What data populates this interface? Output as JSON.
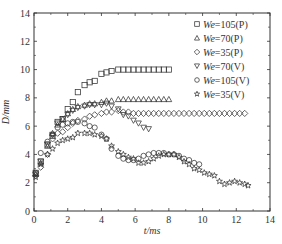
{
  "chart_data": {
    "type": "scatter",
    "title": "",
    "xlabel": "t/ms",
    "ylabel": "D/mm",
    "xlim": [
      0,
      14
    ],
    "ylim": [
      0,
      14
    ],
    "x_ticks": [
      0,
      2,
      4,
      6,
      8,
      10,
      12,
      14
    ],
    "y_ticks": [
      0,
      2,
      4,
      6,
      8,
      10,
      12,
      14
    ],
    "grid": false,
    "legend_position": "upper right",
    "series": [
      {
        "name": "We=105(P)",
        "marker": "square",
        "x": [
          0.1,
          0.4,
          0.8,
          1.1,
          1.4,
          1.7,
          2.0,
          2.3,
          2.6,
          3.0,
          3.3,
          3.6,
          4.0,
          4.3,
          4.6,
          5.0,
          5.3,
          5.6,
          5.9,
          6.2,
          6.5,
          6.8,
          7.1,
          7.4,
          7.7,
          8.0
        ],
        "y": [
          2.7,
          3.5,
          4.7,
          5.3,
          6.3,
          6.5,
          7.2,
          7.7,
          8.4,
          8.9,
          9.1,
          9.2,
          9.7,
          9.8,
          9.9,
          10.0,
          10.0,
          10.0,
          10.0,
          10.0,
          10.0,
          10.0,
          10.0,
          10.0,
          10.0,
          10.0
        ]
      },
      {
        "name": "We=70(P)",
        "marker": "triangle-up",
        "x": [
          0.1,
          0.4,
          0.8,
          1.1,
          1.4,
          1.7,
          2.0,
          2.3,
          2.6,
          3.0,
          3.3,
          3.6,
          4.0,
          4.3,
          4.6,
          5.0,
          5.3,
          5.6,
          5.9,
          6.2,
          6.5,
          6.8,
          7.1,
          7.4,
          7.7,
          8.0
        ],
        "y": [
          2.6,
          3.4,
          4.6,
          5.5,
          6.1,
          6.5,
          6.9,
          7.2,
          7.4,
          7.5,
          7.6,
          7.6,
          7.7,
          7.8,
          7.8,
          7.9,
          7.9,
          7.9,
          7.9,
          7.9,
          7.9,
          7.9,
          7.9,
          7.9,
          7.9,
          7.9
        ]
      },
      {
        "name": "We=35(P)",
        "marker": "diamond",
        "x": [
          0.1,
          0.4,
          0.8,
          1.1,
          1.4,
          1.7,
          2.0,
          2.3,
          2.6,
          3.0,
          3.3,
          3.6,
          4.0,
          4.3,
          4.6,
          5.0,
          5.3,
          5.6,
          5.9,
          6.2,
          6.5,
          6.8,
          7.1,
          7.4,
          7.7,
          8.0,
          8.3,
          8.6,
          8.9,
          9.2,
          9.5,
          9.8,
          10.1,
          10.4,
          10.7,
          11.0,
          11.3,
          11.6,
          11.9,
          12.2,
          12.5
        ],
        "y": [
          2.5,
          3.1,
          4.0,
          5.1,
          5.5,
          5.6,
          5.9,
          6.2,
          6.4,
          6.5,
          6.7,
          6.8,
          6.9,
          7.0,
          7.0,
          7.1,
          7.0,
          7.0,
          6.9,
          6.9,
          6.9,
          6.9,
          6.9,
          6.9,
          6.9,
          6.9,
          6.9,
          6.9,
          6.9,
          6.9,
          6.9,
          6.9,
          6.9,
          6.9,
          6.9,
          6.9,
          6.9,
          6.9,
          6.9,
          6.9,
          6.9
        ]
      },
      {
        "name": "We=70(V)",
        "marker": "triangle-down",
        "x": [
          0.1,
          0.4,
          0.8,
          1.1,
          1.4,
          1.7,
          2.0,
          2.3,
          2.6,
          3.0,
          3.3,
          3.6,
          4.0,
          4.3,
          4.6,
          5.0,
          5.3,
          5.6,
          5.9,
          6.2,
          6.5,
          6.8
        ],
        "y": [
          2.6,
          3.5,
          4.7,
          5.4,
          6.2,
          6.5,
          6.8,
          7.1,
          7.3,
          7.4,
          7.5,
          7.5,
          7.5,
          7.6,
          7.4,
          7.2,
          6.8,
          6.7,
          6.4,
          6.2,
          5.9,
          5.8
        ]
      },
      {
        "name": "We=105(V)",
        "marker": "circle",
        "x": [
          0.1,
          0.4,
          0.8,
          1.1,
          1.4,
          1.7,
          2.0,
          2.3,
          2.6,
          3.0,
          3.3,
          3.6,
          4.0,
          4.3,
          4.6,
          5.0,
          5.3,
          5.6,
          5.9,
          6.2,
          6.5,
          6.8,
          7.1,
          7.4,
          7.7,
          8.0,
          8.3,
          8.6,
          8.9,
          9.2,
          9.5,
          9.8
        ],
        "y": [
          2.7,
          4.1,
          4.9,
          5.4,
          5.9,
          6.1,
          6.2,
          6.3,
          6.3,
          6.2,
          6.0,
          5.9,
          5.4,
          5.1,
          4.4,
          3.9,
          3.7,
          3.6,
          3.6,
          3.7,
          3.9,
          4.0,
          4.1,
          4.1,
          4.1,
          4.0,
          4.0,
          3.9,
          3.7,
          3.6,
          3.4,
          3.3
        ]
      },
      {
        "name": "We=35(V)",
        "marker": "star",
        "x": [
          0.1,
          0.4,
          0.8,
          1.1,
          1.4,
          1.7,
          2.0,
          2.3,
          2.6,
          3.0,
          3.3,
          3.6,
          4.0,
          4.3,
          4.6,
          5.0,
          5.3,
          5.6,
          5.9,
          6.2,
          6.5,
          6.8,
          7.1,
          7.4,
          7.7,
          8.0,
          8.3,
          8.6,
          8.9,
          9.2,
          9.5,
          9.8,
          10.1,
          10.4,
          10.7,
          11.0,
          11.3,
          11.6,
          11.9,
          12.2,
          12.5,
          12.7
        ],
        "y": [
          2.4,
          3.3,
          4.0,
          4.4,
          4.8,
          5.0,
          5.1,
          5.2,
          5.5,
          5.5,
          5.5,
          5.4,
          5.3,
          5.1,
          4.6,
          4.2,
          4.0,
          3.8,
          3.7,
          3.4,
          3.4,
          3.5,
          3.7,
          3.9,
          4.0,
          4.0,
          4.0,
          3.8,
          3.5,
          3.3,
          3.0,
          2.9,
          2.7,
          2.6,
          2.5,
          2.1,
          1.9,
          2.0,
          2.1,
          2.0,
          1.9,
          1.8
        ]
      }
    ]
  },
  "axes": {
    "xlabel": "t/ms",
    "ylabel": "D/mm",
    "x_tick_labels": [
      "0",
      "2",
      "4",
      "6",
      "8",
      "10",
      "12",
      "14"
    ],
    "y_tick_labels": [
      "0",
      "2",
      "4",
      "6",
      "8",
      "10",
      "12",
      "14"
    ]
  },
  "legend": {
    "items": [
      {
        "prefix": "We",
        "label": "=105(P)",
        "marker": "square"
      },
      {
        "prefix": "We",
        "label": "=70(P)",
        "marker": "triangle-up"
      },
      {
        "prefix": "We",
        "label": "=35(P)",
        "marker": "diamond"
      },
      {
        "prefix": "We",
        "label": "=70(V)",
        "marker": "triangle-down"
      },
      {
        "prefix": "We",
        "label": "=105(V)",
        "marker": "circle"
      },
      {
        "prefix": "We",
        "label": "=35(V)",
        "marker": "star"
      }
    ]
  },
  "colors": {
    "axis": "#333333",
    "marker": "#333333",
    "background": "#ffffff"
  }
}
